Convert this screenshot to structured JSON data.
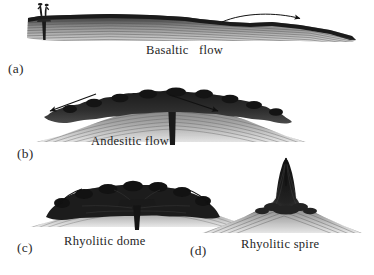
{
  "figure": {
    "background_color": "#ffffff",
    "ink_color": "#1e1e1e",
    "width": 374,
    "height": 275
  },
  "panels": [
    {
      "id": "a",
      "marker": "(a)",
      "caption": "Basaltic   flow",
      "morphology": "low-profile fissure-fed lava flow",
      "vent": "central fissure vent with small spatter fountain",
      "arrows": [
        {
          "name": "basaltic-flow-arrow",
          "direction": "right",
          "style": "curved",
          "meaning": "lateral flow away from vent"
        }
      ],
      "texture": "horizontally stratified flow layers with dark upper crust"
    },
    {
      "id": "b",
      "marker": "(b)",
      "caption": "Andesitic flow",
      "morphology": "broad low dome with thick blocky carapace",
      "vent": "central conduit feeding a surface dome",
      "arrows": [
        {
          "name": "andesitic-flow-arrow-left",
          "direction": "down-left",
          "style": "straight",
          "meaning": "outward spreading of flow"
        },
        {
          "name": "andesitic-flow-arrow-right",
          "direction": "down-right",
          "style": "straight",
          "meaning": "outward spreading of flow"
        }
      ],
      "texture": "radiating fan of flow lines beneath dark rubbly carapace"
    },
    {
      "id": "c",
      "marker": "(c)",
      "caption": "Rhyolitic dome",
      "morphology": "steep-sided endogenous dome",
      "vent": "narrow central conduit with flared top",
      "arrows": [
        {
          "name": "rhyolitic-dome-arrow-left",
          "direction": "down-left",
          "style": "curved",
          "meaning": "outward and downward dome growth"
        },
        {
          "name": "rhyolitic-dome-arrow-right",
          "direction": "down-right",
          "style": "curved",
          "meaning": "outward and downward dome growth"
        }
      ],
      "texture": "dark massive dome over flow-banded substrate"
    },
    {
      "id": "d",
      "marker": "(d)",
      "caption": "Rhyolitic spire",
      "morphology": "narrow extruded spire above a low apron",
      "vent": "central conduit extruding a vertical plug",
      "arrows": [
        {
          "name": "rhyolitic-spire-arrow",
          "direction": "up",
          "style": "straight",
          "meaning": "vertical extrusion of spire"
        }
      ],
      "texture": "steeply converging flow lines into central spire"
    }
  ]
}
